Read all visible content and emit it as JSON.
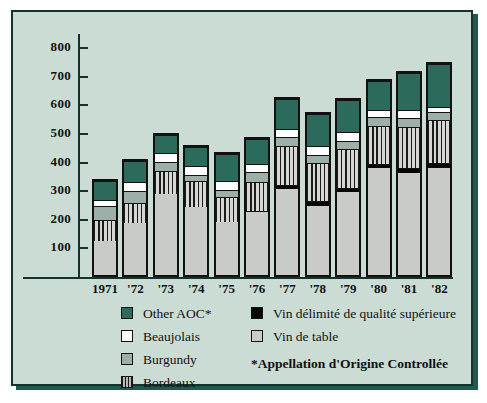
{
  "chart_data": {
    "type": "bar",
    "subtype": "stacked-vertical",
    "title": "",
    "xlabel": "",
    "ylabel": "",
    "ylim": [
      0,
      800
    ],
    "yticks": [
      100,
      200,
      300,
      400,
      500,
      600,
      700,
      800
    ],
    "grid": false,
    "legend_position": "bottom",
    "categories": [
      "1971",
      "'72",
      "'73",
      "'74",
      "'75",
      "'76",
      "'77",
      "'78",
      "'79",
      "'80",
      "'81",
      "'82"
    ],
    "series": [
      {
        "name": "Vin de table",
        "color": "#c9cbc6",
        "values": [
          125,
          188,
          292,
          247,
          190,
          225,
          308,
          247,
          295,
          380,
          365,
          380
        ]
      },
      {
        "name": "Vin délimité de qualité supérieure",
        "color": "#070707",
        "values": [
          0,
          0,
          0,
          0,
          0,
          7,
          14,
          18,
          17,
          15,
          17,
          18
        ]
      },
      {
        "name": "Bordeaux",
        "color": "#808080",
        "pattern": "vertical-stripes",
        "values": [
          75,
          74,
          83,
          91,
          90,
          103,
          140,
          137,
          138,
          135,
          146,
          154
        ]
      },
      {
        "name": "Burgundy",
        "color": "#9cb0a9",
        "values": [
          50,
          43,
          30,
          24,
          27,
          37,
          30,
          26,
          28,
          33,
          32,
          28
        ]
      },
      {
        "name": "Beaujolais",
        "color": "#ffffff",
        "values": [
          25,
          33,
          33,
          31,
          33,
          28,
          30,
          34,
          34,
          27,
          28,
          18
        ]
      },
      {
        "name": "Other AOC*",
        "color": "#2c6b5c",
        "values": [
          67,
          74,
          64,
          69,
          95,
          90,
          108,
          116,
          115,
          102,
          132,
          154
        ]
      }
    ],
    "totals": [
      342,
      412,
      502,
      462,
      435,
      490,
      630,
      578,
      627,
      692,
      720,
      752
    ]
  },
  "legend": {
    "left_column": [
      {
        "label": "Other AOC*",
        "swatch": "dark-green"
      },
      {
        "label": "Beaujolais",
        "swatch": "white"
      },
      {
        "label": "Burgundy",
        "swatch": "gray-green"
      },
      {
        "label": "Bordeaux",
        "swatch": "striped-gray"
      }
    ],
    "right_column": [
      {
        "label": "Vin délimité de qualité supérieure",
        "swatch": "black"
      },
      {
        "label": "Vin de table",
        "swatch": "light-gray"
      }
    ],
    "footnote": "*Appellation d'Origine Controllée"
  },
  "colors": {
    "background": "#cadcd4",
    "frame": "#14332c",
    "shadow": "#1f5a4e",
    "aoc": "#2c6b5c",
    "beaujolais": "#ffffff",
    "burgundy": "#9cb0a9",
    "bordeaux": "#808080",
    "vdqs": "#070707",
    "vin_de_table": "#c9cbc6"
  }
}
